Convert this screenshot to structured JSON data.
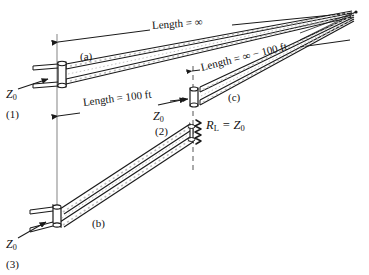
{
  "figure": {
    "background_color": "#ffffff",
    "ink_color": "#1a1a1a",
    "guide_color": "#8a8a8a"
  },
  "dimension_labels": {
    "infinite_length": "Length = ∞",
    "hundred_ft": "Length = 100 ft",
    "infinite_minus_hundred": "Length = ∞ − 100 ft"
  },
  "line_callouts": {
    "a": "(a)",
    "b": "(b)",
    "c": "(c)"
  },
  "circuit_numbers": {
    "one": "(1)",
    "two": "(2)",
    "three": "(3)"
  },
  "impedance_labels": {
    "z0_top": "Z",
    "z0_top_sub": "0",
    "z0_mid": "Z",
    "z0_mid_sub": "0",
    "z0_bottom": "Z",
    "z0_bottom_sub": "0"
  },
  "load_label": {
    "r": "R",
    "r_sub": "L",
    "equals": " = Z",
    "z_sub": "0"
  }
}
